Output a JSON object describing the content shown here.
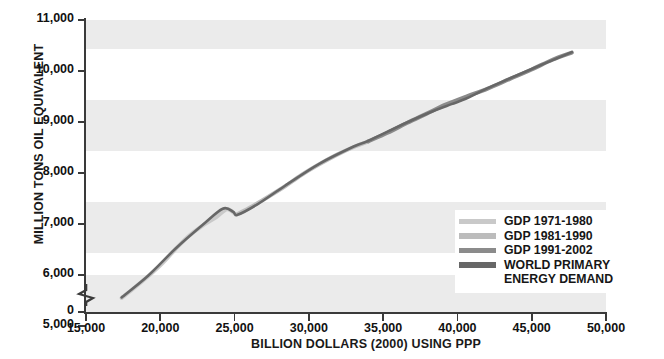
{
  "chart_data": {
    "type": "line",
    "title": "",
    "xlabel": "BILLION DOLLARS (2000) USING PPP",
    "ylabel": "MILLION TONS OIL EQUIVALENT",
    "xlim": [
      15000,
      50000
    ],
    "ylim": [
      4200,
      11000
    ],
    "xticks": [
      "15,000",
      "20,000",
      "25,000",
      "30,000",
      "35,000",
      "40,000",
      "45,000",
      "50,000"
    ],
    "xtick_values": [
      15000,
      20000,
      25000,
      30000,
      35000,
      40000,
      45000,
      50000
    ],
    "yticks": [
      "0",
      "5,000",
      "6,000",
      "7,000",
      "8,000",
      "9,000",
      "10,000",
      "11,000"
    ],
    "ytick_values": [
      4200,
      5000,
      6000,
      7000,
      8000,
      9000,
      10000,
      11000
    ],
    "grid": false,
    "banded_background": true,
    "band_color": "#ebebeb",
    "legend_position": "lower-right-inside",
    "series": [
      {
        "name": "GDP 1971-1980",
        "color": "#c9c9c9",
        "x": [
          17400,
          18300,
          19200,
          20100,
          21000,
          21900,
          22800,
          23700,
          24500,
          25100
        ],
        "y": [
          5550,
          5760,
          5980,
          6220,
          6500,
          6760,
          6960,
          7120,
          7290,
          7180
        ]
      },
      {
        "name": "GDP 1981-1990",
        "color": "#bcbcbc",
        "x": [
          25100,
          26200,
          27300,
          28400,
          29500,
          30700,
          31900,
          33100,
          34000
        ],
        "y": [
          7180,
          7350,
          7540,
          7740,
          7960,
          8170,
          8360,
          8520,
          8620
        ]
      },
      {
        "name": "GDP 1991-2002",
        "color": "#8b8b8b",
        "x": [
          34000,
          35300,
          36600,
          37900,
          39200,
          40600,
          42000,
          43500,
          45000,
          46400,
          47700
        ],
        "y": [
          8620,
          8790,
          8980,
          9160,
          9340,
          9500,
          9650,
          9840,
          10030,
          10220,
          10360
        ]
      },
      {
        "name": "WORLD PRIMARY ENERGY DEMAND",
        "color": "#676767",
        "x": [
          17400,
          19200,
          21000,
          22800,
          24200,
          24900,
          25200,
          26500,
          28400,
          30700,
          33100,
          34000,
          36600,
          38500,
          39600,
          40600,
          42000,
          45000,
          47700
        ],
        "y": [
          5560,
          5990,
          6510,
          6970,
          7300,
          7240,
          7180,
          7380,
          7750,
          8180,
          8530,
          8630,
          8990,
          9230,
          9350,
          9460,
          9660,
          10040,
          10370
        ]
      }
    ],
    "legend_entries": [
      {
        "label": "GDP 1971-1980",
        "color": "#c9c9c9"
      },
      {
        "label": "GDP 1981-1990",
        "color": "#bcbcbc"
      },
      {
        "label": "GDP 1991-2002",
        "color": "#8b8b8b"
      },
      {
        "label": "WORLD PRIMARY",
        "color": "#676767"
      },
      {
        "label": "ENERGY DEMAND",
        "color": ""
      }
    ]
  }
}
